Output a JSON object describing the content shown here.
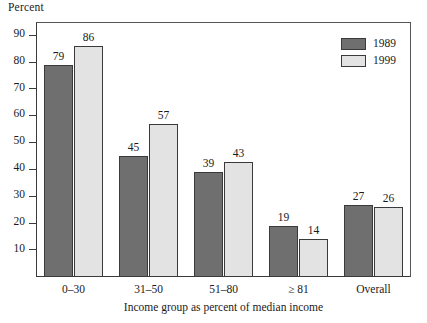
{
  "chart_data": {
    "type": "bar",
    "title": "",
    "ylabel": "Percent",
    "xlabel": "Income group as percent of median income",
    "categories": [
      "0–30",
      "31–50",
      "51–80",
      "≥ 81",
      "Overall"
    ],
    "series": [
      {
        "name": "1989",
        "color": "#6f6f6f",
        "values": [
          79,
          45,
          39,
          19,
          27
        ]
      },
      {
        "name": "1999",
        "color": "#e3e3e3",
        "values": [
          86,
          57,
          43,
          14,
          26
        ]
      }
    ],
    "ylim": [
      0,
      95
    ],
    "yticks": [
      10,
      20,
      30,
      40,
      50,
      60,
      70,
      80,
      90
    ],
    "ytick_labels": [
      "10",
      "20",
      "30",
      "40",
      "50",
      "60",
      "70",
      "80",
      "90"
    ],
    "grid": false,
    "legend_position": "top-right",
    "value_labels_shown": true
  },
  "legend": {
    "entries": [
      {
        "label": "1989"
      },
      {
        "label": "1999"
      }
    ]
  },
  "axes": {
    "y_title": "Percent",
    "x_title": "Income group as percent of median income"
  }
}
